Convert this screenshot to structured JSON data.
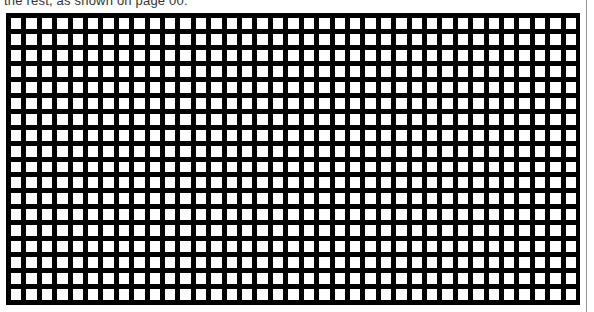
{
  "caption": {
    "text": "the rest, as shown on page 00."
  },
  "grid": {
    "columns": 37,
    "rows": 18,
    "line_color": "#000000",
    "cell_color": "#ffffff"
  },
  "page": {
    "edge_line_color": "#9a9a9a"
  }
}
